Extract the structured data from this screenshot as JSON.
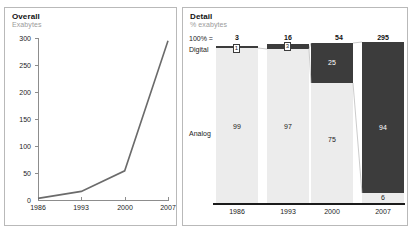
{
  "faint_header": "",
  "panels": {
    "overall": {
      "title": "Overall",
      "subtitle": "Exabytes"
    },
    "detail": {
      "title": "Detail",
      "subtitle": "% exabytes"
    }
  },
  "detail_labels": {
    "hundred_percent": "100% =",
    "digital": "Digital",
    "analog": "Analog"
  },
  "colors": {
    "digital": "#3c3c3c",
    "analog": "#ececec",
    "line": "#6b6b6b",
    "axis": "#8d8d8d",
    "panel_border": "#b9b9b9",
    "subtitle": "#9b9b9b"
  },
  "chart_data": [
    {
      "type": "line",
      "title": "Overall",
      "subtitle": "Exabytes",
      "xlabel": "",
      "ylabel": "Exabytes",
      "x": [
        "1986",
        "1993",
        "2000",
        "2007"
      ],
      "categories": [
        "1986",
        "1993",
        "2000",
        "2007"
      ],
      "values": [
        3,
        16,
        54,
        295
      ],
      "series": [
        {
          "name": "Total storage (exabytes)",
          "values": [
            3,
            16,
            54,
            295
          ]
        }
      ],
      "ylim": [
        0,
        300
      ],
      "yticks": [
        0,
        50,
        100,
        150,
        200,
        250,
        300
      ],
      "ytick_labels": [
        "0",
        "50",
        "100",
        "150",
        "200",
        "250",
        "300"
      ],
      "xtick_labels": [
        "1986",
        "1993",
        "2000",
        "2007"
      ],
      "grid": false,
      "legend": "none"
    },
    {
      "type": "bar",
      "title": "Detail",
      "subtitle": "% exabytes",
      "stacked": true,
      "xlabel": "",
      "ylabel": "% exabytes",
      "categories": [
        "1986",
        "1993",
        "2000",
        "2007"
      ],
      "xtick_labels": [
        "1986",
        "1993",
        "2000",
        "2007"
      ],
      "totals_label": "100% =",
      "totals": [
        3,
        16,
        54,
        295
      ],
      "totals_text": [
        "3",
        "16",
        "54",
        "295"
      ],
      "series": [
        {
          "name": "Digital",
          "values": [
            1,
            3,
            25,
            94
          ],
          "labels": [
            "1",
            "3",
            "25",
            "94"
          ],
          "color": "#3c3c3c"
        },
        {
          "name": "Analog",
          "values": [
            99,
            97,
            75,
            6
          ],
          "labels": [
            "99",
            "97",
            "75",
            "6"
          ],
          "color": "#ececec"
        }
      ],
      "ylim": [
        0,
        100
      ],
      "grid": false,
      "legend": "inline-left"
    }
  ]
}
